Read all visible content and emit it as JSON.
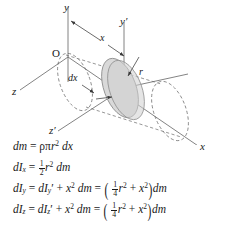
{
  "figure": {
    "type": "technical-diagram",
    "background_color": "#ffffff",
    "line_color": "#3a3a3a",
    "disk_fill_color": "#d9d9d9",
    "labels": {
      "y_axis": "y",
      "y_prime_axis": "y′",
      "x_axis": "x",
      "z_axis": "z",
      "z_prime_axis": "z′",
      "origin": "O",
      "distance_x": "x",
      "thickness_dx": "dx",
      "radius_r": "r"
    }
  },
  "equations": [
    {
      "id": "eq-dm",
      "lhs": "dm",
      "rhs": "ρπr² dx",
      "text": "dm = ρπr² dx"
    },
    {
      "id": "eq-dIx",
      "lhs": "dIₓ",
      "fraction": "1/2",
      "rhs": "½ r² dm",
      "text": "dIₓ = ½ r² dm"
    },
    {
      "id": "eq-dIy",
      "lhs": "dIᵧ",
      "middle": "dIᵧ′ + x² dm",
      "fraction": "1/4",
      "rhs": "(¼ r² + x²) dm",
      "text": "dIᵧ = dIᵧ′ + x² dm = (¼ r² + x²) dm"
    },
    {
      "id": "eq-dIz",
      "lhs": "dI₂",
      "middle": "dI₂′ + x² dm",
      "fraction": "1/4",
      "rhs": "(¼ r² + x²) dm",
      "text": "dI₂ = dI₂′ + x² dm = (¼ r² + x²) dm"
    }
  ],
  "symbols": {
    "d": "d",
    "m": "m",
    "I": "I",
    "equals": "=",
    "plus": "+",
    "rho": "ρ",
    "pi": "π",
    "r": "r",
    "x": "x",
    "sub_x": "x",
    "sub_y": "y",
    "sub_z": "z",
    "prime": "′",
    "sup_two": "2",
    "lparen": "(",
    "rparen": ")",
    "one": "1",
    "two": "2",
    "four": "4",
    "dx_lit": "dx",
    "dm_lit": "dm"
  }
}
